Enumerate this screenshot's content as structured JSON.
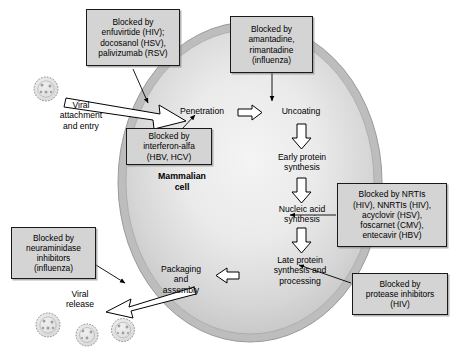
{
  "figure": {
    "cell_label": {
      "line1": "Mammalian",
      "line2": "cell"
    }
  },
  "stages": [
    {
      "name": "viral-attachment-and-entry",
      "lines": [
        "Viral",
        "attachment",
        "and entry"
      ]
    },
    {
      "name": "penetration",
      "lines": [
        "Penetration"
      ]
    },
    {
      "name": "uncoating",
      "lines": [
        "Uncoating"
      ]
    },
    {
      "name": "early-protein-synthesis",
      "lines": [
        "Early protein",
        "synthesis"
      ]
    },
    {
      "name": "nucleic-acid-synthesis",
      "lines": [
        "Nucleic acid",
        "synthesis"
      ]
    },
    {
      "name": "late-protein-synthesis-and-processing",
      "lines": [
        "Late protein",
        "synthesis and",
        "processing"
      ]
    },
    {
      "name": "packaging-and-assembly",
      "lines": [
        "Packaging",
        "and",
        "assembly"
      ]
    },
    {
      "name": "viral-release",
      "lines": [
        "Viral",
        "release"
      ]
    }
  ],
  "callouts": [
    {
      "name": "blocked-by-entry-inhibitors",
      "lines": [
        "Blocked by",
        "enfuvirtide (HIV);",
        "docosanol (HSV),",
        "palivizumab (RSV)"
      ]
    },
    {
      "name": "blocked-by-uncoating-inhibitors",
      "lines": [
        "Blocked by",
        "amantadine,",
        "rimantadine",
        "(influenza)"
      ]
    },
    {
      "name": "blocked-by-interferon-alfa",
      "lines": [
        "Blocked by",
        "interferon-alfa",
        "(HBV, HCV)"
      ]
    },
    {
      "name": "blocked-by-nucleic-acid-synthesis-inhibitors",
      "lines": [
        "Blocked by NRTIs",
        "(HIV), NNRTIs (HIV),",
        "acyclovir (HSV),",
        "foscarnet (CMV),",
        "entecavir (HBV)"
      ]
    },
    {
      "name": "blocked-by-protease-inhibitors",
      "lines": [
        "Blocked by",
        "protease inhibitors",
        "(HIV)"
      ]
    },
    {
      "name": "blocked-by-neuraminidase-inhibitors",
      "lines": [
        "Blocked by",
        "neuraminidase",
        "inhibitors",
        "(influenza)"
      ]
    }
  ],
  "colors": {
    "callout_fill": "#d4d4d4",
    "callout_border": "#1a1a1a",
    "membrane": "#b3b3b3",
    "cytoplasm_light": "#f2f2f2",
    "cytoplasm_dark": "#c9c9c9",
    "arrow_fill": "#ffffff",
    "arrow_stroke": "#000000",
    "virion": "#e6e6e6",
    "background": "#ffffff"
  },
  "virions": {
    "free_count": 1,
    "released_count": 3
  }
}
